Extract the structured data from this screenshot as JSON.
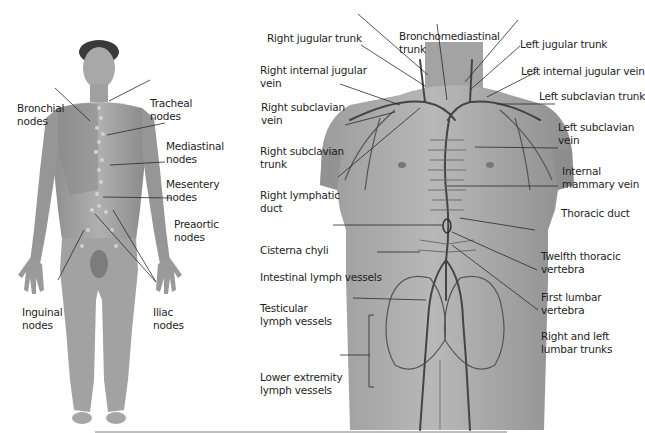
{
  "figure": {
    "left_panel": {
      "title": "Lymph node groups (full body, anterior view)",
      "labels": [
        {
          "id": "bronchial",
          "lines": [
            "Bronchial",
            "nodes"
          ]
        },
        {
          "id": "tracheal",
          "lines": [
            "Tracheal",
            "nodes"
          ]
        },
        {
          "id": "mediastinal",
          "lines": [
            "Mediastinal",
            "nodes"
          ]
        },
        {
          "id": "mesentery",
          "lines": [
            "Mesentery",
            "nodes"
          ]
        },
        {
          "id": "preaortic",
          "lines": [
            "Preaortic",
            "nodes"
          ]
        },
        {
          "id": "inguinal",
          "lines": [
            "Inguinal",
            "nodes"
          ]
        },
        {
          "id": "iliac",
          "lines": [
            "Iliac",
            "nodes"
          ]
        }
      ]
    },
    "right_panel": {
      "title": "Lymphatic vessels and ducts of the trunk",
      "labels": [
        {
          "id": "right-jugular-trunk",
          "lines": [
            "Right jugular trunk"
          ]
        },
        {
          "id": "bronchomediastinal-trunk",
          "lines": [
            "Bronchomediastinal",
            "trunk"
          ]
        },
        {
          "id": "left-jugular-trunk",
          "lines": [
            "Left jugular trunk"
          ]
        },
        {
          "id": "right-internal-jugular-vein",
          "lines": [
            "Right internal jugular",
            "vein"
          ]
        },
        {
          "id": "left-internal-jugular-vein",
          "lines": [
            "Left internal jugular vein"
          ]
        },
        {
          "id": "right-subclavian-vein",
          "lines": [
            "Right subclavian",
            "vein"
          ]
        },
        {
          "id": "left-subclavian-trunk",
          "lines": [
            "Left subclavian trunk"
          ]
        },
        {
          "id": "left-subclavian-vein",
          "lines": [
            "Left subclavian",
            "vein"
          ]
        },
        {
          "id": "right-subclavian-trunk",
          "lines": [
            "Right subclavian",
            "trunk"
          ]
        },
        {
          "id": "internal-mammary-vein",
          "lines": [
            "Internal",
            "mammary vein"
          ]
        },
        {
          "id": "right-lymphatic-duct",
          "lines": [
            "Right lymphatic",
            "duct"
          ]
        },
        {
          "id": "thoracic-duct",
          "lines": [
            "Thoracic duct"
          ]
        },
        {
          "id": "cisterna-chyli",
          "lines": [
            "Cisterna chyli"
          ]
        },
        {
          "id": "twelfth-thoracic-vertebra",
          "lines": [
            "Twelfth thoracic",
            "vertebra"
          ]
        },
        {
          "id": "intestinal-lymph-vessels",
          "lines": [
            "Intestinal lymph vessels"
          ]
        },
        {
          "id": "first-lumbar-vertebra",
          "lines": [
            "First lumbar",
            "vertebra"
          ]
        },
        {
          "id": "testicular-lymph-vessels",
          "lines": [
            "Testicular",
            "lymph vessels"
          ]
        },
        {
          "id": "right-left-lumbar-trunks",
          "lines": [
            "Right and left",
            "lumbar trunks"
          ]
        },
        {
          "id": "lower-extremity-lymph-vessels",
          "lines": [
            "Lower extremity",
            "lymph vessels"
          ]
        }
      ]
    },
    "colors": {
      "skin": "#9a9a9a",
      "skin_light": "#c4c4c4",
      "vessel": "#4a4a4a",
      "leader": "#2a2a2a",
      "label_text": "#1e1e1e",
      "rule": "#bdbdbd"
    }
  }
}
